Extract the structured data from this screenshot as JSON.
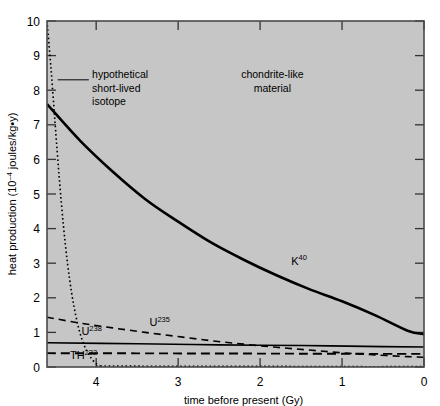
{
  "chart_data": {
    "type": "line",
    "title": "",
    "xlabel": "time before present (Gy)",
    "ylabel": "heat production (10⁻⁴ joules/kg·y)",
    "ylabel_main": "heat production (10",
    "ylabel_exp": "–4",
    "ylabel_tail": " joules/kg•y)",
    "xlim": [
      4.6,
      0
    ],
    "ylim": [
      0,
      10
    ],
    "x_ticks": [
      "4",
      "3",
      "2",
      "1",
      "0"
    ],
    "x_tick_values": [
      4,
      3,
      2,
      1,
      0
    ],
    "y_ticks": [
      "0",
      "1",
      "2",
      "3",
      "4",
      "5",
      "6",
      "7",
      "8",
      "9",
      "10"
    ],
    "y_tick_values": [
      0,
      1,
      2,
      3,
      4,
      5,
      6,
      7,
      8,
      9,
      10
    ],
    "grid": false,
    "legend": "none",
    "plot_background": "#c6c6c6",
    "frame_color": "#4a4a4a",
    "line_color": "#000000",
    "annotations": [
      {
        "name": "hypothetical-isotope-annotation",
        "lines": [
          "hypothetical",
          "short-lived",
          "isotope"
        ],
        "x": 4.05,
        "y": 8.35
      },
      {
        "name": "chondrite-material-annotation",
        "lines": [
          "chondrite-like",
          "material"
        ],
        "x": 1.85,
        "y": 8.35
      }
    ],
    "series": [
      {
        "name": "K40",
        "label": "K",
        "label_sup": "40",
        "style": "solid-thick",
        "label_x": 1.62,
        "label_y": 2.95,
        "x": [
          4.6,
          4.2,
          3.8,
          3.4,
          3.0,
          2.6,
          2.2,
          1.8,
          1.4,
          1.0,
          0.6,
          0.2,
          0.0
        ],
        "y": [
          7.6,
          6.55,
          5.65,
          4.85,
          4.2,
          3.6,
          3.1,
          2.65,
          2.25,
          1.9,
          1.5,
          1.05,
          0.95
        ]
      },
      {
        "name": "U238",
        "label": "U",
        "label_sup": "238",
        "style": "solid-thin",
        "label_x": 4.18,
        "label_y": 0.92,
        "x": [
          4.6,
          3.5,
          2.5,
          1.5,
          0.5,
          0.0
        ],
        "y": [
          0.7,
          0.67,
          0.64,
          0.62,
          0.59,
          0.58
        ]
      },
      {
        "name": "U235",
        "label": "U",
        "label_sup": "235",
        "style": "dashed",
        "label_x": 3.35,
        "label_y": 1.18,
        "x": [
          4.6,
          4.2,
          3.8,
          3.4,
          3.0,
          2.6,
          2.2,
          1.8,
          1.4,
          1.0,
          0.6,
          0.2,
          0.0
        ],
        "y": [
          1.44,
          1.27,
          1.13,
          1.0,
          0.88,
          0.76,
          0.66,
          0.57,
          0.49,
          0.41,
          0.35,
          0.3,
          0.28
        ]
      },
      {
        "name": "TH232",
        "label": "TH",
        "label_sup": "232",
        "style": "dashed-long",
        "label_x": 4.32,
        "label_y": 0.22,
        "x": [
          4.6,
          3.5,
          2.5,
          1.5,
          0.5,
          0.0
        ],
        "y": [
          0.4,
          0.395,
          0.39,
          0.385,
          0.38,
          0.38
        ]
      },
      {
        "name": "hypothetical-short-lived-isotope",
        "label": "",
        "label_sup": "",
        "style": "dotted",
        "x": [
          4.6,
          4.55,
          4.5,
          4.45,
          4.4,
          4.35,
          4.3,
          4.25,
          4.2,
          4.15,
          4.1,
          4.05,
          4.0,
          3.95
        ],
        "y": [
          10.0,
          8.6,
          7.0,
          5.45,
          4.1,
          3.0,
          2.15,
          1.5,
          1.0,
          0.65,
          0.4,
          0.22,
          0.1,
          0.03
        ]
      },
      {
        "name": "hypothetical-isotope-baseline",
        "label": "",
        "label_sup": "",
        "style": "dotted-flat",
        "x": [
          4.0,
          3.0,
          2.0,
          1.0,
          0.0
        ],
        "y": [
          0.03,
          0.02,
          0.02,
          0.01,
          0.01
        ]
      }
    ]
  }
}
